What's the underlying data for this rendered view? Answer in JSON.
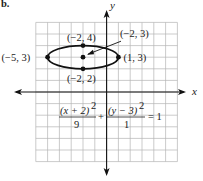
{
  "figure": {
    "part_label": "b.",
    "axes": {
      "x_label": "x",
      "y_label": "y",
      "grid": {
        "x_min": -6,
        "x_max": 6,
        "y_min": -6,
        "y_max": 6,
        "step": 1
      },
      "grid_color": "#b5b5b5",
      "axis_color": "#111111"
    },
    "ellipse": {
      "center": [
        -2,
        3
      ],
      "semi_major_x": 3,
      "semi_minor_y": 1,
      "stroke": "#111111"
    },
    "points": [
      {
        "label": "(−5, 3)",
        "x": -5,
        "y": 3
      },
      {
        "label": "(1, 3)",
        "x": 1,
        "y": 3
      },
      {
        "label": "(−2, 4)",
        "x": -2,
        "y": 4
      },
      {
        "label": "(−2, 2)",
        "x": -2,
        "y": 2
      },
      {
        "label": "(−2, 3)",
        "x": -2,
        "y": 3
      }
    ],
    "equation": {
      "term1_num": "(x + 2)",
      "term1_den": "9",
      "plus": "+",
      "term2_num": "(y − 3)",
      "term2_den": "1",
      "exp": "2",
      "equals": "= 1"
    }
  }
}
